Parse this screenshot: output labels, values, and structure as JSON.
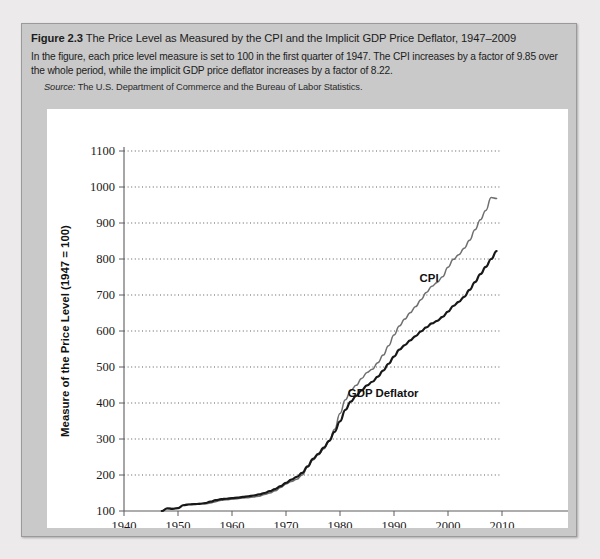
{
  "figure": {
    "number_label": "Figure 2.3",
    "title": "The Price Level as Measured by the CPI and the Implicit GDP Price Deflator, 1947–2009",
    "body": "In the figure, each price level measure is set to 100 in the first quarter of 1947. The CPI increases by a factor of 9.85 over the whole period, while the implicit GDP price deflator increases by a factor of 8.22.",
    "source_lead": "Source:",
    "source_text": " The U.S. Department of Commerce and the Bureau of Labor Statistics."
  },
  "chart_data": {
    "type": "line",
    "title": "The Price Level as Measured by the CPI and the Implicit GDP Price Deflator, 1947–2009",
    "xlabel": "Year",
    "ylabel": "Measure of the Price Level (1947 = 100)",
    "xlim": [
      1940,
      2010
    ],
    "ylim": [
      100,
      1100
    ],
    "xticks": [
      1940,
      1950,
      1960,
      1970,
      1980,
      1990,
      2000,
      2010
    ],
    "yticks": [
      100,
      200,
      300,
      400,
      500,
      600,
      700,
      800,
      900,
      1000,
      1100
    ],
    "grid": true,
    "legend_position": "inline-annotation",
    "colors": {
      "cpi": "#6f6f6f",
      "deflator": "#181818"
    },
    "annotations": [
      {
        "text": "CPI",
        "x": 1996.5,
        "y": 735
      },
      {
        "text": "GDP Deflator",
        "x": 1988.0,
        "y": 418
      }
    ],
    "series": [
      {
        "name": "CPI",
        "x": [
          1947,
          1948,
          1949,
          1950,
          1951,
          1952,
          1953,
          1954,
          1955,
          1956,
          1957,
          1958,
          1959,
          1960,
          1961,
          1962,
          1963,
          1964,
          1965,
          1966,
          1967,
          1968,
          1969,
          1970,
          1971,
          1972,
          1973,
          1974,
          1975,
          1976,
          1977,
          1978,
          1979,
          1980,
          1981,
          1982,
          1983,
          1984,
          1985,
          1986,
          1987,
          1988,
          1989,
          1990,
          1991,
          1992,
          1993,
          1994,
          1995,
          1996,
          1997,
          1998,
          1999,
          2000,
          2001,
          2002,
          2003,
          2004,
          2005,
          2006,
          2007,
          2008,
          2009
        ],
        "values": [
          100,
          108,
          107,
          108,
          117,
          119,
          120,
          121,
          120,
          122,
          126,
          130,
          131,
          133,
          134,
          136,
          137,
          139,
          141,
          146,
          150,
          156,
          165,
          175,
          182,
          188,
          200,
          222,
          242,
          256,
          273,
          294,
          327,
          371,
          409,
          435,
          449,
          468,
          485,
          494,
          512,
          533,
          559,
          589,
          614,
          633,
          651,
          668,
          687,
          707,
          724,
          735,
          751,
          777,
          799,
          812,
          830,
          852,
          881,
          909,
          935,
          971,
          968
        ],
        "width": 1.5,
        "color": "#6f6f6f"
      },
      {
        "name": "GDP Deflator",
        "x": [
          1947,
          1948,
          1949,
          1950,
          1951,
          1952,
          1953,
          1954,
          1955,
          1956,
          1957,
          1958,
          1959,
          1960,
          1961,
          1962,
          1963,
          1964,
          1965,
          1966,
          1967,
          1968,
          1969,
          1970,
          1971,
          1972,
          1973,
          1974,
          1975,
          1976,
          1977,
          1978,
          1979,
          1980,
          1981,
          1982,
          1983,
          1984,
          1985,
          1986,
          1987,
          1988,
          1989,
          1990,
          1991,
          1992,
          1993,
          1994,
          1995,
          1996,
          1997,
          1998,
          1999,
          2000,
          2001,
          2002,
          2003,
          2004,
          2005,
          2006,
          2007,
          2008,
          2009
        ],
        "values": [
          100,
          107,
          106,
          108,
          116,
          118,
          119,
          120,
          122,
          126,
          130,
          133,
          134,
          136,
          137,
          139,
          141,
          143,
          146,
          150,
          155,
          161,
          169,
          178,
          187,
          195,
          206,
          224,
          245,
          259,
          276,
          295,
          320,
          349,
          381,
          404,
          420,
          435,
          449,
          459,
          473,
          490,
          509,
          529,
          548,
          561,
          574,
          586,
          599,
          610,
          621,
          628,
          639,
          654,
          670,
          681,
          695,
          714,
          736,
          758,
          778,
          800,
          822
        ],
        "width": 2.2,
        "color": "#181818"
      }
    ]
  }
}
